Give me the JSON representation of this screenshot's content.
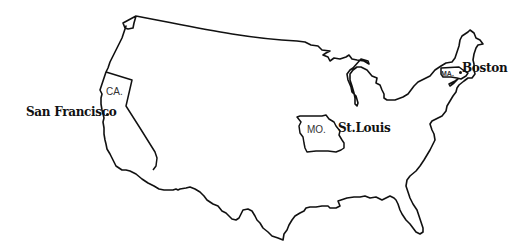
{
  "map": {
    "title": "",
    "region": "Continental United States",
    "line_color": "#111111",
    "background": "#ffffff",
    "states": [
      {
        "abbr": "CA.",
        "name": "California"
      },
      {
        "abbr": "MO.",
        "name": "Missouri"
      },
      {
        "abbr": "MA.",
        "name": "Massachusetts"
      }
    ],
    "cities": [
      {
        "name": "San Francisco",
        "state": "CA."
      },
      {
        "name": "St. Louis",
        "label": "St.Louis",
        "state": "MO."
      },
      {
        "name": "Boston",
        "state": "MA."
      }
    ]
  }
}
